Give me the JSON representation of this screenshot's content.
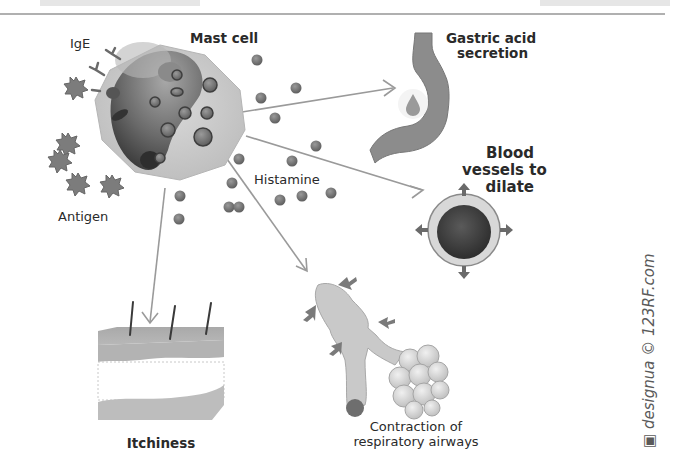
{
  "diagram": {
    "labels": {
      "ige": "IgE",
      "mast_cell": "Mast cell",
      "antigen": "Antigen",
      "histamine": "Histamine",
      "gastric_line1": "Gastric acid",
      "gastric_line2": "secretion",
      "blood_line1": "Blood",
      "blood_line2": "vessels to",
      "blood_line3": "dilate",
      "itchiness": "Itchiness",
      "airways_line1": "Contraction of",
      "airways_line2": "respiratory airways"
    },
    "watermark": "designua © 123RF.com",
    "icons": [
      "mast-cell",
      "antibody-y",
      "antigen-star",
      "histamine-granule",
      "stomach",
      "acid-drop",
      "blood-vessel-cross-section",
      "skin-layer",
      "bronchi-alveoli",
      "arrow"
    ],
    "colors": {
      "cell_fill": "#cfcfcf",
      "nucleus": "#6a6a6a",
      "granule": "#6e6e6e",
      "arrow": "#9a9a9a",
      "stomach": "#8c8c8c",
      "vessel_ring": "#d8d8d8",
      "vessel_lumen": "#3c3c3c",
      "text": "#2a2a2a"
    }
  }
}
